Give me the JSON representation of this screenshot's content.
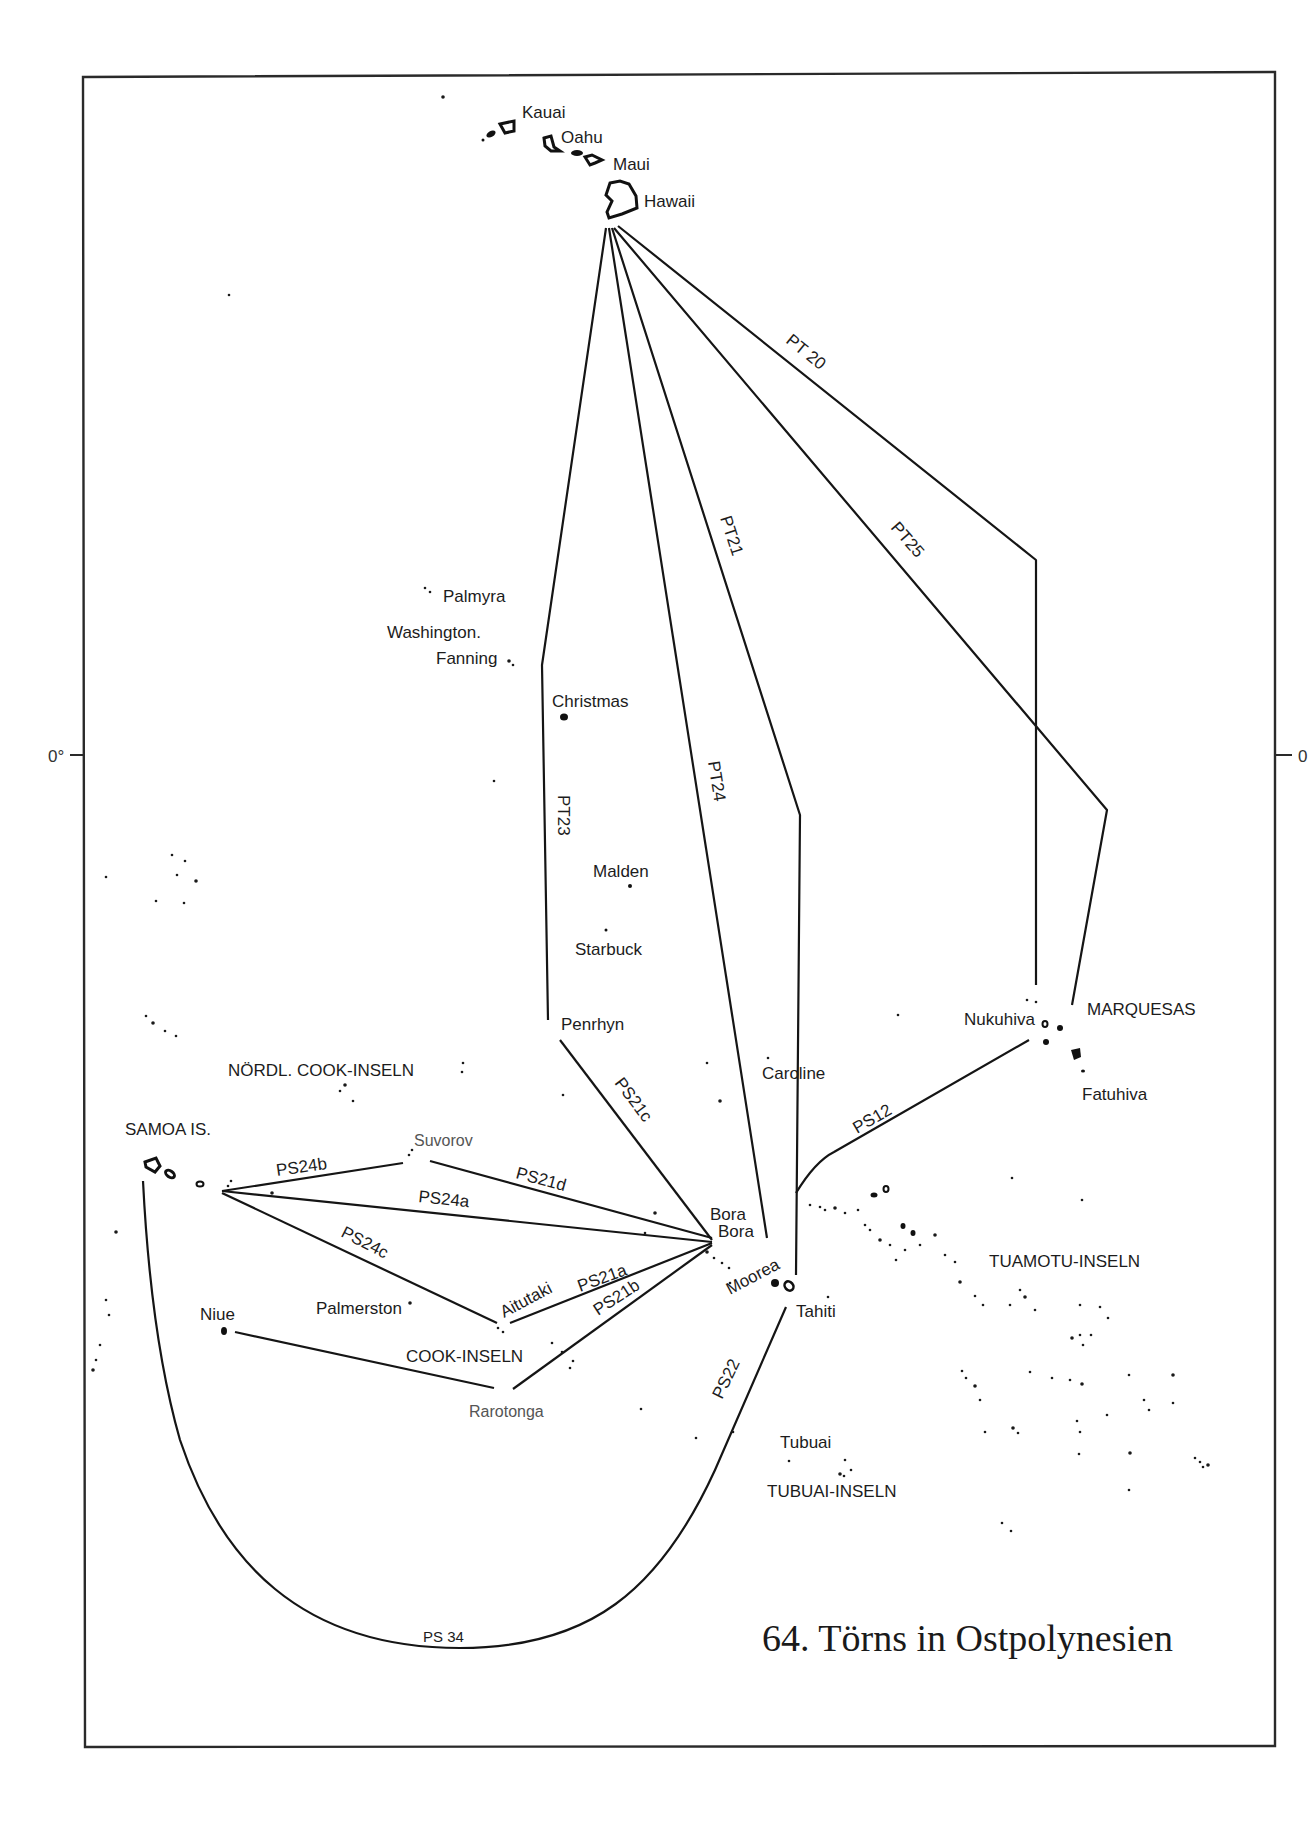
{
  "title": "64. Törns in Ostpolynesien",
  "equator_label": "0°",
  "equator_label_right": "0",
  "islands": [
    {
      "id": "kauai",
      "name": "Kauai"
    },
    {
      "id": "oahu",
      "name": "Oahu"
    },
    {
      "id": "maui",
      "name": "Maui"
    },
    {
      "id": "hawaii",
      "name": "Hawaii"
    },
    {
      "id": "palmyra",
      "name": "Palmyra"
    },
    {
      "id": "washington",
      "name": "Washington."
    },
    {
      "id": "fanning",
      "name": "Fanning"
    },
    {
      "id": "christmas",
      "name": "Christmas"
    },
    {
      "id": "malden",
      "name": "Malden"
    },
    {
      "id": "starbuck",
      "name": "Starbuck"
    },
    {
      "id": "penrhyn",
      "name": "Penrhyn"
    },
    {
      "id": "caroline",
      "name": "Caroline"
    },
    {
      "id": "nukuhiva",
      "name": "Nukuhiva"
    },
    {
      "id": "fatuhiva",
      "name": "Fatuhiva"
    },
    {
      "id": "suvorov",
      "name": "Suvorov"
    },
    {
      "id": "bora1",
      "name": "Bora"
    },
    {
      "id": "bora2",
      "name": "Bora"
    },
    {
      "id": "moorea",
      "name": "Moorea"
    },
    {
      "id": "tahiti",
      "name": "Tahiti"
    },
    {
      "id": "aitutaki",
      "name": "Aitutaki"
    },
    {
      "id": "palmerston",
      "name": "Palmerston"
    },
    {
      "id": "niue",
      "name": "Niue"
    },
    {
      "id": "rarotonga",
      "name": "Rarotonga"
    },
    {
      "id": "tubuai",
      "name": "Tubuai"
    }
  ],
  "regions": [
    {
      "id": "marquesas",
      "name": "MARQUESAS"
    },
    {
      "id": "nordl-cook",
      "name": "NÖRDL. COOK-INSELN"
    },
    {
      "id": "samoa",
      "name": "SAMOA IS."
    },
    {
      "id": "cook",
      "name": "COOK-INSELN"
    },
    {
      "id": "tuamotu",
      "name": "TUAMOTU-INSELN"
    },
    {
      "id": "tubuai-inseln",
      "name": "TUBUAI-INSELN"
    }
  ],
  "routes": [
    {
      "id": "PT20",
      "label": "PT 20",
      "from": "Hawaii",
      "to": "Marquesas"
    },
    {
      "id": "PT25",
      "label": "PT25",
      "from": "Hawaii",
      "to": "Marquesas"
    },
    {
      "id": "PT21",
      "label": "PT21",
      "from": "Hawaii",
      "to": "Tahiti"
    },
    {
      "id": "PT24",
      "label": "PT24",
      "from": "Hawaii",
      "to": "Bora Bora"
    },
    {
      "id": "PT23",
      "label": "PT23",
      "from": "Hawaii",
      "to": "Penrhyn"
    },
    {
      "id": "PS21c",
      "label": "PS21c",
      "from": "Penrhyn",
      "to": "Bora Bora"
    },
    {
      "id": "PS21d",
      "label": "PS21d",
      "from": "Suvorov",
      "to": "Bora Bora"
    },
    {
      "id": "PS24a",
      "label": "PS24a",
      "from": "Samoa",
      "to": "Bora Bora"
    },
    {
      "id": "PS24b",
      "label": "PS24b",
      "from": "Samoa",
      "to": "Suvorov"
    },
    {
      "id": "PS24c",
      "label": "PS24c",
      "from": "Samoa",
      "to": "Aitutaki"
    },
    {
      "id": "PS21a",
      "label": "PS21a",
      "from": "Aitutaki",
      "to": "Bora Bora"
    },
    {
      "id": "PS21b",
      "label": "PS21b",
      "from": "Rarotonga",
      "to": "Bora Bora"
    },
    {
      "id": "PS12",
      "label": "PS12",
      "from": "Tahiti",
      "to": "Nukuhiva"
    },
    {
      "id": "PS22",
      "label": "PS22",
      "from": "Tahiti",
      "to": "PS34"
    },
    {
      "id": "PS34",
      "label": "PS 34",
      "from": "Samoa",
      "to": "Tahiti"
    },
    {
      "id": "niue-rarotonga",
      "label": "",
      "from": "Niue",
      "to": "Rarotonga"
    }
  ]
}
